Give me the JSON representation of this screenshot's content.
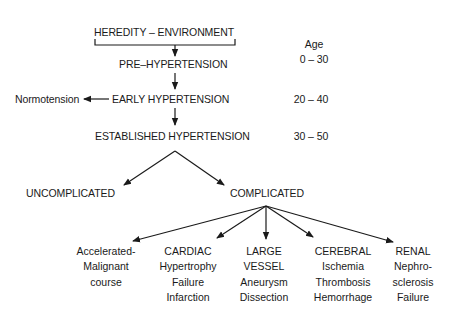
{
  "diagram": {
    "top": "HEREDITY – ENVIRONMENT",
    "stages": [
      {
        "label": "PRE–HYPERTENSION",
        "age": "0 – 30"
      },
      {
        "label": "EARLY HYPERTENSION",
        "age": "20 – 40"
      },
      {
        "label": "ESTABLISHED HYPERTENSION",
        "age": "30 – 50"
      }
    ],
    "age_header": "Age",
    "side_branch": "Normotension",
    "outcomes": {
      "uncomplicated": "UNCOMPLICATED",
      "complicated": "COMPLICATED"
    },
    "complications": [
      {
        "lines": [
          "Accelerated-",
          "Malignant",
          "course"
        ]
      },
      {
        "lines": [
          "CARDIAC",
          "Hypertrophy",
          "Failure",
          "Infarction"
        ]
      },
      {
        "lines": [
          "LARGE",
          "VESSEL",
          "Aneurysm",
          "Dissection"
        ]
      },
      {
        "lines": [
          "CEREBRAL",
          "Ischemia",
          "Thrombosis",
          "Hemorrhage"
        ]
      },
      {
        "lines": [
          "RENAL",
          "Nephro-",
          "sclerosis",
          "Failure"
        ]
      }
    ]
  },
  "colors": {
    "line": "#1a1a1a",
    "background": "#ffffff"
  }
}
